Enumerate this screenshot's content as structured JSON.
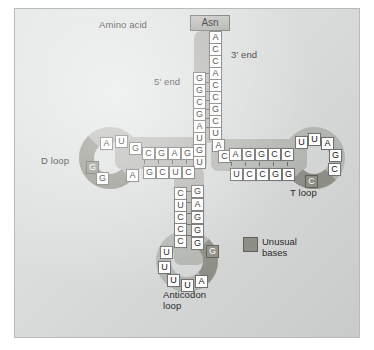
{
  "figure": {
    "background_color": "#dcdede",
    "base_fill": "#fdfdfb",
    "unusual_base_fill": "#8d8f86",
    "ribbon_color": "#b3b5b0"
  },
  "labels": {
    "amino_acid": "Amino acid",
    "three_prime": "3' end",
    "five_prime": "5' end",
    "d_loop": "D loop",
    "t_loop": "T loop",
    "anticodon_line1": "Anticodon",
    "anticodon_line2": "loop"
  },
  "amino_acid_tag": {
    "text": "Asn"
  },
  "legend": {
    "label_line1": "Unusual",
    "label_line2": "bases",
    "swatch_color": "#8d8f86"
  },
  "acceptor_stem": {
    "three_prime_strand": [
      "A",
      "C",
      "C",
      "A",
      "C",
      "C",
      "G",
      "C",
      "U",
      "A",
      "C"
    ],
    "five_prime_strand": [
      "G",
      "G",
      "C",
      "G",
      "A",
      "U",
      "G",
      "U"
    ],
    "pair_count": 7
  },
  "d_arm": {
    "top_strand": [
      "C",
      "G",
      "A",
      "G"
    ],
    "bottom_strand": [
      "G",
      "C",
      "U",
      "C"
    ],
    "loop_bases": [
      "A",
      "U",
      "G",
      "G",
      "G",
      "A"
    ],
    "loop_unusual": [
      false,
      false,
      false,
      true,
      false,
      true
    ]
  },
  "t_arm": {
    "top_strand": [
      "A",
      "G",
      "G",
      "C",
      "C"
    ],
    "bottom_strand": [
      "U",
      "C",
      "C",
      "G",
      "G"
    ],
    "loop_bases": [
      "U",
      "U",
      "A",
      "G",
      "C",
      "C"
    ],
    "loop_unusual": [
      false,
      false,
      false,
      false,
      false,
      true
    ]
  },
  "anticodon_arm": {
    "left_strand": [
      "C",
      "U",
      "C",
      "C",
      "C"
    ],
    "right_strand": [
      "G",
      "A",
      "G",
      "G",
      "G"
    ],
    "loop_bases": [
      "U",
      "U",
      "U",
      "U",
      "A",
      "G"
    ],
    "loop_unusual": [
      false,
      false,
      false,
      false,
      false,
      true
    ]
  }
}
